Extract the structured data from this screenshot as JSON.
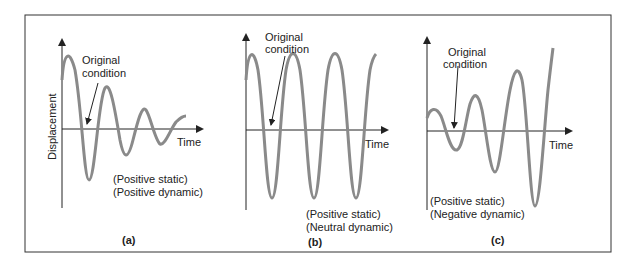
{
  "figure": {
    "y_axis_label": "Displacement",
    "x_axis_label": "Time",
    "annotation": [
      "Original",
      "condition"
    ],
    "curve_color": "#8a8a8a",
    "axis_color": "#222222"
  },
  "panels": [
    {
      "id": "a",
      "caption": "(a)",
      "notes": [
        "(Positive static)",
        "(Positive dynamic)"
      ],
      "behavior": "damped oscillation"
    },
    {
      "id": "b",
      "caption": "(b)",
      "notes": [
        "(Positive static)",
        "(Neutral dynamic)"
      ],
      "behavior": "constant-amplitude oscillation"
    },
    {
      "id": "c",
      "caption": "(c)",
      "notes": [
        "(Positive static)",
        "(Negative dynamic)"
      ],
      "behavior": "divergent oscillation"
    }
  ]
}
